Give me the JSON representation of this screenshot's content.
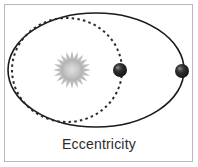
{
  "figure": {
    "caption": "Eccentricity",
    "frame": {
      "border_color": "#b9b6c0",
      "background_color": "#ffffff"
    }
  },
  "diagram": {
    "type": "orbital-eccentricity-illustration",
    "elements": {
      "elliptical_orbit": {
        "name": "elliptical-orbit",
        "style": "solid",
        "stroke_color": "#1a1a1a",
        "stroke_width": 1.6,
        "center_x": 96,
        "center_y": 70,
        "radius_x": 88,
        "radius_y": 57
      },
      "circular_orbit": {
        "name": "circular-orbit",
        "style": "dashed",
        "stroke_color": "#2a2a2a",
        "stroke_width": 2,
        "dash_pattern": "2.5 3.2",
        "center_x": 67,
        "center_y": 70,
        "radius_x": 55,
        "radius_y": 52
      },
      "sun": {
        "name": "sun",
        "center_x": 72,
        "center_y": 70,
        "core_radius": 11,
        "ray_radius": 19,
        "ray_count": 20,
        "core_color": "#c9c9c9",
        "ray_color": "#b8b8b8"
      },
      "planet_inner": {
        "name": "planet-on-circular-orbit",
        "center_x": 120,
        "center_y": 70,
        "radius": 7,
        "body_color": "#1b1b1b",
        "highlight_color": "#6e6e6e"
      },
      "planet_outer": {
        "name": "planet-on-elliptical-orbit",
        "center_x": 182,
        "center_y": 71,
        "radius": 7,
        "body_color": "#1b1b1b",
        "highlight_color": "#6e6e6e"
      }
    }
  }
}
